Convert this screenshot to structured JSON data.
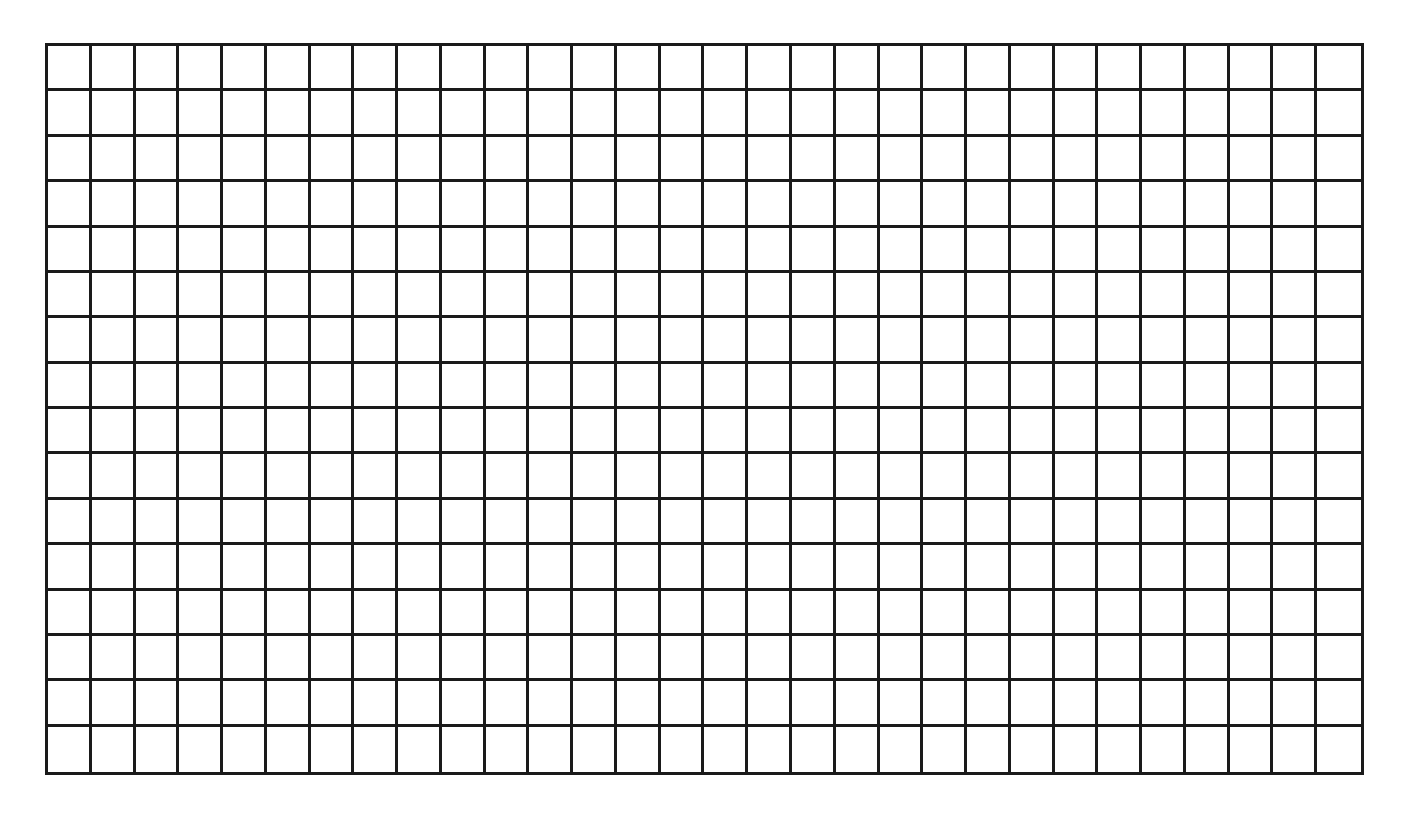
{
  "grid": {
    "columns": 30,
    "rows": 16,
    "line_color": "#1a1a1a",
    "cell_color": "#ffffff",
    "cells_filled": []
  }
}
